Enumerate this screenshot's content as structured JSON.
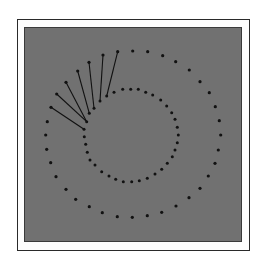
{
  "figure": {
    "colors": {
      "background": "#ffffff",
      "frame_border": "#2a2a2a",
      "panel": "#717171",
      "dot": "#111111",
      "line": "#111111"
    },
    "inner_circle": {
      "dots": [
        [
          114,
          92.3
        ],
        [
          122.7,
          89.3
        ],
        [
          130.7,
          89.3
        ],
        [
          138.3,
          89.3
        ],
        [
          145.7,
          92.3
        ],
        [
          152.7,
          95
        ],
        [
          160.7,
          100
        ],
        [
          166.7,
          106
        ],
        [
          171.7,
          112.7
        ],
        [
          175,
          119.3
        ],
        [
          177.3,
          127.3
        ],
        [
          178.3,
          135
        ],
        [
          177.3,
          142.7
        ],
        [
          175,
          150
        ],
        [
          172.3,
          156.7
        ],
        [
          167.3,
          163.3
        ],
        [
          161.7,
          169.3
        ],
        [
          155,
          174
        ],
        [
          147.3,
          178.3
        ],
        [
          139.3,
          180.7
        ],
        [
          131.7,
          181.7
        ],
        [
          123.3,
          181.7
        ],
        [
          115.7,
          179.3
        ],
        [
          109,
          176
        ],
        [
          101.7,
          171.7
        ],
        [
          95,
          165
        ],
        [
          90,
          160
        ],
        [
          87.3,
          152.3
        ],
        [
          85.7,
          144.3
        ],
        [
          84.3,
          136.7
        ],
        [
          84,
          129.3
        ],
        [
          86.7,
          121.7
        ],
        [
          89.3,
          113.3
        ],
        [
          94,
          108.3
        ],
        [
          100,
          101
        ],
        [
          106.7,
          96
        ]
      ]
    },
    "outer_circle": {
      "dots": [
        [
          132.7,
          51
        ],
        [
          147.7,
          51.7
        ],
        [
          162.7,
          55.7
        ],
        [
          175.7,
          61.7
        ],
        [
          189.3,
          70
        ],
        [
          200,
          81.7
        ],
        [
          209.3,
          92.7
        ],
        [
          215.3,
          106.7
        ],
        [
          219.3,
          120.7
        ],
        [
          220.7,
          135
        ],
        [
          218.3,
          150
        ],
        [
          215,
          163.3
        ],
        [
          208.3,
          176
        ],
        [
          200,
          188.3
        ],
        [
          189,
          197.7
        ],
        [
          176,
          206
        ],
        [
          161.7,
          212.3
        ],
        [
          147.3,
          215.7
        ],
        [
          132.3,
          217.3
        ],
        [
          117.3,
          216.7
        ],
        [
          102.3,
          212.7
        ],
        [
          89.3,
          206.7
        ],
        [
          75.7,
          199.3
        ],
        [
          66,
          189.3
        ],
        [
          56,
          176.7
        ],
        [
          50.7,
          162.7
        ],
        [
          46.7,
          149.3
        ],
        [
          45.7,
          135
        ],
        [
          47.3,
          121.7
        ],
        [
          51,
          107.3
        ],
        [
          56.7,
          94
        ],
        [
          66,
          82.3
        ],
        [
          77.7,
          71
        ],
        [
          89,
          62.3
        ],
        [
          103,
          55
        ],
        [
          117.7,
          51.7
        ]
      ]
    },
    "connectors": [
      {
        "from": [
          117.7,
          51.7
        ],
        "to": [
          106.7,
          96
        ]
      },
      {
        "from": [
          103,
          55
        ],
        "to": [
          100,
          101
        ]
      },
      {
        "from": [
          89,
          62.3
        ],
        "to": [
          94,
          108.3
        ]
      },
      {
        "from": [
          77.7,
          71
        ],
        "to": [
          89.3,
          113.3
        ]
      },
      {
        "from": [
          66,
          82.3
        ],
        "to": [
          86.7,
          121.7
        ]
      },
      {
        "from": [
          56.7,
          94
        ],
        "to": [
          86.7,
          121.7
        ]
      },
      {
        "from": [
          51,
          107.3
        ],
        "to": [
          84,
          129.3
        ]
      }
    ]
  }
}
